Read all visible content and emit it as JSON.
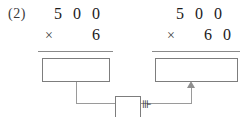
{
  "worksheet": {
    "problem_number": "(2)",
    "relation_mark": "⊪"
  },
  "problems": [
    {
      "id": "left",
      "multiplicand": "5 0 0",
      "operator": "×",
      "multiplier": "6",
      "answer": ""
    },
    {
      "id": "right",
      "multiplicand": "5 0 0",
      "operator": "×",
      "multiplier": "6 0",
      "answer": ""
    }
  ],
  "center_box": {
    "value": ""
  },
  "colors": {
    "ink": "#1b1b1b",
    "rule": "#8a8a8a",
    "box_border": "#7d7d7d",
    "connector": "#9a9a9a",
    "paper": "#ffffff"
  }
}
